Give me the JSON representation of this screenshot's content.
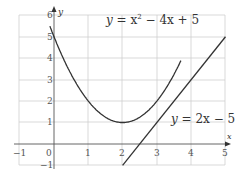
{
  "chart_data": {
    "type": "line",
    "title": "",
    "xlabel": "x",
    "ylabel": "y",
    "xlim": [
      -1,
      5
    ],
    "ylim": [
      -1,
      6
    ],
    "grid": true,
    "x_ticks": [
      "-1",
      "0",
      "1",
      "2",
      "3",
      "4",
      "5"
    ],
    "y_ticks": [
      "-1",
      "1",
      "2",
      "3",
      "4",
      "5",
      "6"
    ],
    "series": [
      {
        "name": "y = x² − 4x + 5",
        "x": [
          -0.1,
          0,
          0.5,
          1,
          1.5,
          2,
          2.5,
          3,
          3.5,
          3.7
        ],
        "values": [
          5.41,
          5,
          3.25,
          2,
          1.25,
          1,
          1.25,
          2,
          3.25,
          3.89
        ],
        "label_parts": {
          "lhs": "y",
          "eq": " = ",
          "x": "x",
          "sup": "2",
          "rest": " − 4x + 5"
        }
      },
      {
        "name": "y = 2x − 5",
        "x": [
          2,
          5
        ],
        "values": [
          -1,
          5
        ],
        "label_parts": {
          "lhs": "y",
          "eq": " = 2x − 5"
        }
      }
    ]
  },
  "labels": {
    "axis_x": "x",
    "axis_y": "y",
    "origin": "0",
    "curve_y": "y",
    "curve_eq1": " = x",
    "curve_sup": "2",
    "curve_eq2": " − 4x + 5",
    "line_y": "y",
    "line_eq": " = 2x − 5"
  },
  "ticks": {
    "xm1": "−1",
    "x1": "1",
    "x2": "2",
    "x3": "3",
    "x4": "4",
    "x5": "5",
    "ym1": "−1",
    "y1": "1",
    "y2": "2",
    "y3": "3",
    "y4": "4",
    "y5": "5",
    "y6": "6"
  }
}
